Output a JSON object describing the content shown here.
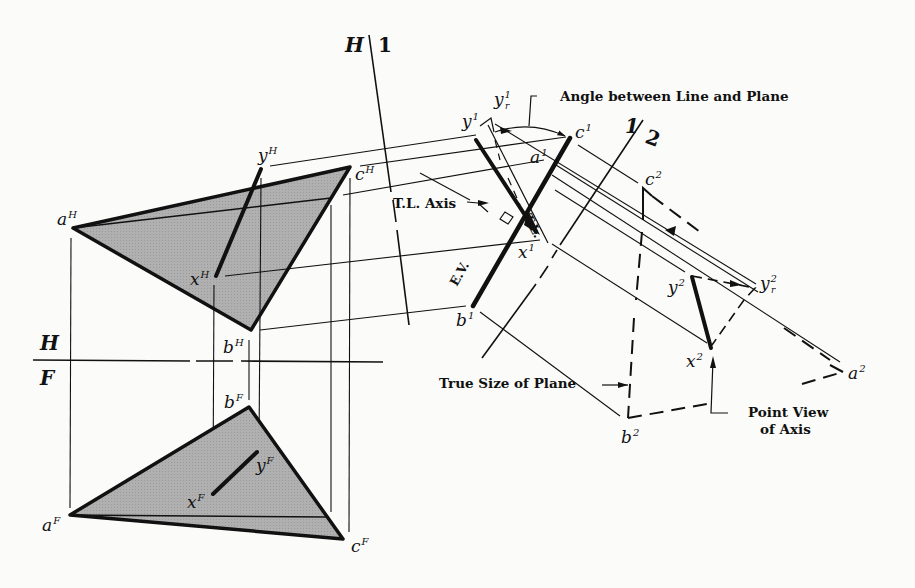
{
  "figure": {
    "background_color": "#fbfbfa",
    "plane_fill_color": "#a9a9a9",
    "line_color": "#111111"
  },
  "fold_lines": {
    "hf_top": "H",
    "hf_bottom": "F",
    "h1_left": "H",
    "h1_right": "1",
    "v12_left": "1",
    "v12_right": "2"
  },
  "points": {
    "horizontal_view": {
      "a": {
        "base": "a",
        "sup": "H"
      },
      "b": {
        "base": "b",
        "sup": "H"
      },
      "c": {
        "base": "c",
        "sup": "H"
      },
      "x": {
        "base": "x",
        "sup": "H"
      },
      "y": {
        "base": "y",
        "sup": "H"
      }
    },
    "front_view": {
      "a": {
        "base": "a",
        "sup": "F"
      },
      "b": {
        "base": "b",
        "sup": "F"
      },
      "c": {
        "base": "c",
        "sup": "F"
      },
      "x": {
        "base": "x",
        "sup": "F"
      },
      "y": {
        "base": "y",
        "sup": "F"
      }
    },
    "view_1": {
      "a": {
        "base": "a",
        "sup": "1"
      },
      "b": {
        "base": "b",
        "sup": "1"
      },
      "c": {
        "base": "c",
        "sup": "1"
      },
      "x": {
        "base": "x",
        "sup": "1"
      },
      "y": {
        "base": "y",
        "sup": "1"
      },
      "yr": {
        "base": "y",
        "sup": "1",
        "sub": "r"
      }
    },
    "view_2": {
      "a": {
        "base": "a",
        "sup": "2"
      },
      "b": {
        "base": "b",
        "sup": "2"
      },
      "c": {
        "base": "c",
        "sup": "2"
      },
      "x": {
        "base": "x",
        "sup": "2"
      },
      "y": {
        "base": "y",
        "sup": "2"
      },
      "yr": {
        "base": "y",
        "sup": "2",
        "sub": "r"
      }
    }
  },
  "annotations": {
    "angle": "Angle between Line and Plane",
    "tl_axis": "T.L. Axis",
    "tl": "T.L.",
    "ev": "E.V.",
    "true_size": "True Size of Plane",
    "point_view_line1": "Point View",
    "point_view_line2": "of Axis"
  }
}
